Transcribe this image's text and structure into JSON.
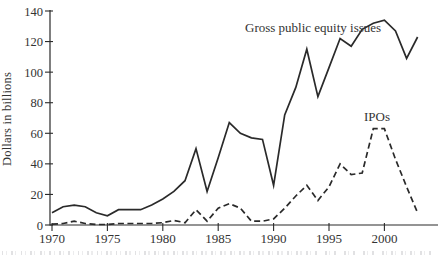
{
  "figure": {
    "background": "#ffffff",
    "line_color": "#2a2a2a",
    "text_color": "#333333"
  },
  "chart_data": {
    "type": "line",
    "title": "",
    "xlabel": "",
    "ylabel": "Dollars in billions",
    "ylim": [
      0,
      140
    ],
    "yticks": [
      0,
      20,
      40,
      60,
      80,
      100,
      120,
      140
    ],
    "xticks": [
      1970,
      1975,
      1980,
      1985,
      1990,
      1995,
      2000
    ],
    "grid": false,
    "legend": "inline-annotations",
    "x": [
      1970,
      1971,
      1972,
      1973,
      1974,
      1975,
      1976,
      1977,
      1978,
      1979,
      1980,
      1981,
      1982,
      1983,
      1984,
      1985,
      1986,
      1987,
      1988,
      1989,
      1990,
      1991,
      1992,
      1993,
      1994,
      1995,
      1996,
      1997,
      1998,
      1999,
      2000,
      2001,
      2002,
      2003
    ],
    "series": [
      {
        "name": "Gross public equity issues",
        "style": "solid",
        "values": [
          8,
          12,
          13,
          12,
          8,
          6,
          10,
          10,
          10,
          13,
          17,
          22,
          29,
          50,
          22,
          44,
          67,
          60,
          57,
          56,
          26,
          72,
          90,
          115,
          84,
          103,
          122,
          117,
          128,
          132,
          134,
          127,
          109,
          123
        ]
      },
      {
        "name": "IPOs",
        "style": "dashed",
        "values": [
          0.5,
          1,
          2.5,
          1,
          0.3,
          0.3,
          1,
          1,
          1,
          1,
          1.5,
          3,
          1.5,
          10,
          2.5,
          11,
          14,
          11,
          2.5,
          2.5,
          4,
          11,
          19,
          26,
          16,
          25,
          40,
          33,
          34,
          63,
          63,
          43,
          25,
          8
        ]
      }
    ]
  },
  "annotations": {
    "gross_label": "Gross public equity issues",
    "ipos_label": "IPOs"
  }
}
